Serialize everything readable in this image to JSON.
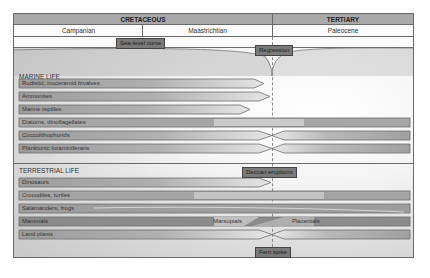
{
  "header": {
    "periods": [
      {
        "label": "CRETACEOUS"
      },
      {
        "label": "TERTIARY"
      }
    ],
    "stages": [
      {
        "label": "Campanian"
      },
      {
        "label": "Maastrichtian"
      },
      {
        "label": "Paleocene"
      }
    ]
  },
  "events": {
    "sea_level": "Sea-level curve",
    "regression": "Regression",
    "deccan": "Deccan eruptions",
    "fern_spike": "Fern spike"
  },
  "marine": {
    "title": "MARINE LIFE",
    "rows": [
      {
        "label": "Rudistid, inoceramid bivalves",
        "fate": "extinct"
      },
      {
        "label": "Ammonites",
        "fate": "extinct"
      },
      {
        "label": "Marine reptiles",
        "fate": "extinct"
      },
      {
        "label": "Diatoms, dinoflagellates",
        "fate": "survive"
      },
      {
        "label": "Coccolithophorids",
        "fate": "bottleneck"
      },
      {
        "label": "Planktonic foraminiferans",
        "fate": "bottleneck"
      }
    ]
  },
  "terrestrial": {
    "title": "TERRESTRIAL LIFE",
    "rows": [
      {
        "label": "Dinosaurs",
        "fate": "extinct"
      },
      {
        "label": "Crocodiles, turtles",
        "fate": "survive"
      },
      {
        "label": "Salamanders, frogs",
        "fate": "survive"
      },
      {
        "label": "Mammals",
        "fate": "turnover",
        "before": "Marsupials",
        "after": "Placentals"
      },
      {
        "label": "Land plants",
        "fate": "bottleneck"
      }
    ]
  },
  "colors": {
    "header_bg": "#a9a9a9",
    "bar": "#a0a0a0",
    "tag_bg": "#7a7a7a",
    "border": "#6a6a6a"
  }
}
